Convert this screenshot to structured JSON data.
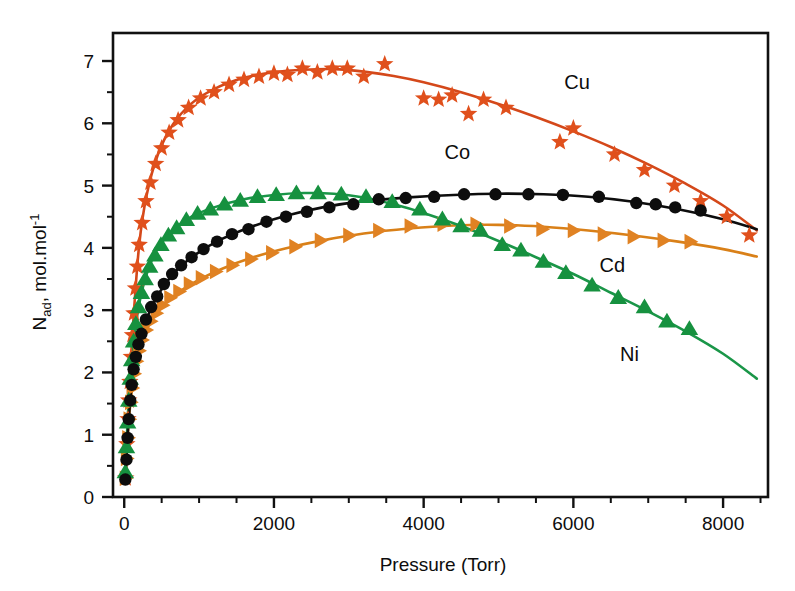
{
  "chart_data": {
    "type": "scatter",
    "title": "",
    "xlabel": "Pressure (Torr)",
    "ylabel": "N_ad, mol.mol-1",
    "ylabel_parts": {
      "main": "N",
      "sub": "ad",
      "rest": ", mol.mol",
      "sup": "-1"
    },
    "xlim": [
      -150,
      8600
    ],
    "ylim": [
      0,
      7.45
    ],
    "xticks": [
      0,
      2000,
      4000,
      6000,
      8000
    ],
    "xticklabels": [
      "0",
      "2000",
      "4000",
      "6000",
      "8000"
    ],
    "xtick_minor_step": 500,
    "yticks": [
      0,
      1,
      2,
      3,
      4,
      5,
      6,
      7
    ],
    "yticklabels": [
      "0",
      "1",
      "2",
      "3",
      "4",
      "5",
      "6",
      "7"
    ],
    "ytick_minor_step": 0.5,
    "grid": false,
    "legend_position": "inline-annotations",
    "series": [
      {
        "name": "Cu",
        "marker": "star",
        "color": "#E0501C",
        "line_color": "#D4481A",
        "label_x": 6050,
        "label_y": 6.55,
        "points": [
          [
            20,
            0.3
          ],
          [
            35,
            0.85
          ],
          [
            50,
            1.25
          ],
          [
            60,
            1.55
          ],
          [
            75,
            1.85
          ],
          [
            95,
            2.25
          ],
          [
            110,
            2.6
          ],
          [
            130,
            2.95
          ],
          [
            150,
            3.35
          ],
          [
            175,
            3.7
          ],
          [
            200,
            4.05
          ],
          [
            240,
            4.4
          ],
          [
            290,
            4.75
          ],
          [
            350,
            5.05
          ],
          [
            420,
            5.35
          ],
          [
            500,
            5.6
          ],
          [
            600,
            5.85
          ],
          [
            720,
            6.05
          ],
          [
            860,
            6.25
          ],
          [
            1020,
            6.4
          ],
          [
            1200,
            6.5
          ],
          [
            1400,
            6.62
          ],
          [
            1600,
            6.7
          ],
          [
            1800,
            6.75
          ],
          [
            2000,
            6.8
          ],
          [
            2180,
            6.78
          ],
          [
            2380,
            6.88
          ],
          [
            2580,
            6.82
          ],
          [
            2780,
            6.88
          ],
          [
            2980,
            6.88
          ],
          [
            3200,
            6.75
          ],
          [
            3480,
            6.95
          ],
          [
            4000,
            6.4
          ],
          [
            4200,
            6.38
          ],
          [
            4380,
            6.45
          ],
          [
            4600,
            6.15
          ],
          [
            4800,
            6.38
          ],
          [
            5100,
            6.25
          ],
          [
            5820,
            5.7
          ],
          [
            6000,
            5.92
          ],
          [
            6550,
            5.5
          ],
          [
            6950,
            5.25
          ],
          [
            7350,
            5.0
          ],
          [
            7700,
            4.75
          ],
          [
            8050,
            4.5
          ],
          [
            8350,
            4.2
          ]
        ],
        "fit": [
          [
            20,
            0.3
          ],
          [
            60,
            1.55
          ],
          [
            120,
            2.8
          ],
          [
            200,
            4.05
          ],
          [
            300,
            4.85
          ],
          [
            450,
            5.5
          ],
          [
            650,
            5.98
          ],
          [
            900,
            6.32
          ],
          [
            1200,
            6.55
          ],
          [
            1600,
            6.73
          ],
          [
            2000,
            6.82
          ],
          [
            2400,
            6.86
          ],
          [
            2800,
            6.87
          ],
          [
            3200,
            6.83
          ],
          [
            3600,
            6.76
          ],
          [
            4000,
            6.66
          ],
          [
            4500,
            6.5
          ],
          [
            5000,
            6.31
          ],
          [
            5500,
            6.1
          ],
          [
            6000,
            5.87
          ],
          [
            6500,
            5.62
          ],
          [
            7000,
            5.34
          ],
          [
            7500,
            5.03
          ],
          [
            8000,
            4.68
          ],
          [
            8450,
            4.28
          ]
        ]
      },
      {
        "name": "Co",
        "marker": "circle",
        "color": "#0D0D0D",
        "line_color": "#0D0D0D",
        "label_x": 4450,
        "label_y": 5.42,
        "points": [
          [
            15,
            0.28
          ],
          [
            30,
            0.6
          ],
          [
            45,
            0.95
          ],
          [
            60,
            1.25
          ],
          [
            80,
            1.55
          ],
          [
            100,
            1.8
          ],
          [
            125,
            2.05
          ],
          [
            155,
            2.25
          ],
          [
            190,
            2.45
          ],
          [
            230,
            2.62
          ],
          [
            290,
            2.85
          ],
          [
            360,
            3.05
          ],
          [
            440,
            3.22
          ],
          [
            530,
            3.42
          ],
          [
            640,
            3.58
          ],
          [
            760,
            3.72
          ],
          [
            900,
            3.85
          ],
          [
            1060,
            3.98
          ],
          [
            1240,
            4.1
          ],
          [
            1440,
            4.22
          ],
          [
            1660,
            4.3
          ],
          [
            1900,
            4.42
          ],
          [
            2160,
            4.5
          ],
          [
            2440,
            4.58
          ],
          [
            2740,
            4.65
          ],
          [
            3060,
            4.7
          ],
          [
            3400,
            4.78
          ],
          [
            3760,
            4.8
          ],
          [
            4140,
            4.82
          ],
          [
            4540,
            4.86
          ],
          [
            4960,
            4.86
          ],
          [
            5400,
            4.86
          ],
          [
            5860,
            4.85
          ],
          [
            6340,
            4.82
          ],
          [
            6840,
            4.72
          ],
          [
            7100,
            4.7
          ],
          [
            7360,
            4.65
          ],
          [
            7700,
            4.6
          ]
        ],
        "fit": [
          [
            15,
            0.28
          ],
          [
            60,
            1.25
          ],
          [
            120,
            2.0
          ],
          [
            200,
            2.48
          ],
          [
            320,
            2.92
          ],
          [
            480,
            3.3
          ],
          [
            700,
            3.64
          ],
          [
            960,
            3.9
          ],
          [
            1300,
            4.14
          ],
          [
            1700,
            4.34
          ],
          [
            2150,
            4.51
          ],
          [
            2650,
            4.65
          ],
          [
            3200,
            4.75
          ],
          [
            3800,
            4.81
          ],
          [
            4400,
            4.85
          ],
          [
            5000,
            4.87
          ],
          [
            5600,
            4.86
          ],
          [
            6200,
            4.82
          ],
          [
            6800,
            4.74
          ],
          [
            7400,
            4.62
          ],
          [
            8000,
            4.46
          ],
          [
            8450,
            4.3
          ]
        ]
      },
      {
        "name": "Ni",
        "marker": "triangle-up",
        "color": "#16913F",
        "line_color": "#1A9648",
        "label_x": 6750,
        "label_y": 2.18,
        "points": [
          [
            15,
            0.4
          ],
          [
            30,
            0.8
          ],
          [
            45,
            1.2
          ],
          [
            60,
            1.55
          ],
          [
            80,
            1.9
          ],
          [
            100,
            2.2
          ],
          [
            125,
            2.5
          ],
          [
            155,
            2.78
          ],
          [
            190,
            3.05
          ],
          [
            230,
            3.28
          ],
          [
            280,
            3.5
          ],
          [
            340,
            3.7
          ],
          [
            410,
            3.88
          ],
          [
            490,
            4.05
          ],
          [
            590,
            4.2
          ],
          [
            700,
            4.32
          ],
          [
            830,
            4.45
          ],
          [
            980,
            4.55
          ],
          [
            1150,
            4.62
          ],
          [
            1340,
            4.7
          ],
          [
            1550,
            4.76
          ],
          [
            1780,
            4.82
          ],
          [
            2030,
            4.85
          ],
          [
            2300,
            4.88
          ],
          [
            2590,
            4.88
          ],
          [
            2900,
            4.86
          ],
          [
            3230,
            4.82
          ],
          [
            3580,
            4.74
          ],
          [
            3950,
            4.62
          ],
          [
            4250,
            4.46
          ],
          [
            4500,
            4.35
          ],
          [
            4760,
            4.28
          ],
          [
            5050,
            4.05
          ],
          [
            5300,
            3.96
          ],
          [
            5600,
            3.78
          ],
          [
            5900,
            3.6
          ],
          [
            6250,
            3.4
          ],
          [
            6600,
            3.2
          ],
          [
            6950,
            3.05
          ],
          [
            7250,
            2.82
          ],
          [
            7550,
            2.7
          ]
        ],
        "fit": [
          [
            15,
            0.4
          ],
          [
            60,
            1.55
          ],
          [
            120,
            2.42
          ],
          [
            200,
            3.1
          ],
          [
            300,
            3.58
          ],
          [
            450,
            4.0
          ],
          [
            650,
            4.28
          ],
          [
            900,
            4.5
          ],
          [
            1200,
            4.65
          ],
          [
            1600,
            4.78
          ],
          [
            2000,
            4.85
          ],
          [
            2400,
            4.88
          ],
          [
            2800,
            4.87
          ],
          [
            3200,
            4.81
          ],
          [
            3600,
            4.7
          ],
          [
            4000,
            4.56
          ],
          [
            4500,
            4.35
          ],
          [
            5000,
            4.11
          ],
          [
            5500,
            3.85
          ],
          [
            6000,
            3.58
          ],
          [
            6500,
            3.28
          ],
          [
            7000,
            2.98
          ],
          [
            7500,
            2.66
          ],
          [
            8000,
            2.3
          ],
          [
            8450,
            1.9
          ]
        ]
      },
      {
        "name": "Cd",
        "marker": "triangle-right",
        "color": "#E08223",
        "line_color": "#D98018",
        "label_x": 6520,
        "label_y": 3.62,
        "points": [
          [
            15,
            0.3
          ],
          [
            30,
            0.62
          ],
          [
            48,
            0.95
          ],
          [
            65,
            1.25
          ],
          [
            85,
            1.52
          ],
          [
            105,
            1.75
          ],
          [
            130,
            1.98
          ],
          [
            160,
            2.18
          ],
          [
            195,
            2.35
          ],
          [
            235,
            2.52
          ],
          [
            290,
            2.68
          ],
          [
            350,
            2.82
          ],
          [
            425,
            2.95
          ],
          [
            510,
            3.08
          ],
          [
            610,
            3.2
          ],
          [
            730,
            3.3
          ],
          [
            870,
            3.42
          ],
          [
            1030,
            3.52
          ],
          [
            1220,
            3.62
          ],
          [
            1440,
            3.72
          ],
          [
            1690,
            3.82
          ],
          [
            1970,
            3.92
          ],
          [
            2280,
            4.02
          ],
          [
            2620,
            4.12
          ],
          [
            3000,
            4.2
          ],
          [
            3400,
            4.28
          ],
          [
            3820,
            4.35
          ],
          [
            4260,
            4.38
          ],
          [
            4700,
            4.38
          ],
          [
            5150,
            4.35
          ],
          [
            5580,
            4.3
          ],
          [
            6000,
            4.28
          ],
          [
            6400,
            4.22
          ],
          [
            6800,
            4.18
          ],
          [
            7200,
            4.12
          ],
          [
            7560,
            4.1
          ]
        ],
        "fit": [
          [
            15,
            0.3
          ],
          [
            60,
            1.2
          ],
          [
            120,
            1.88
          ],
          [
            200,
            2.36
          ],
          [
            320,
            2.74
          ],
          [
            480,
            3.02
          ],
          [
            700,
            3.26
          ],
          [
            960,
            3.46
          ],
          [
            1300,
            3.66
          ],
          [
            1700,
            3.84
          ],
          [
            2150,
            3.99
          ],
          [
            2650,
            4.12
          ],
          [
            3200,
            4.23
          ],
          [
            3800,
            4.31
          ],
          [
            4400,
            4.36
          ],
          [
            5000,
            4.37
          ],
          [
            5600,
            4.34
          ],
          [
            6200,
            4.28
          ],
          [
            6800,
            4.2
          ],
          [
            7400,
            4.1
          ],
          [
            8000,
            3.98
          ],
          [
            8450,
            3.86
          ]
        ]
      }
    ]
  }
}
